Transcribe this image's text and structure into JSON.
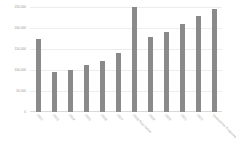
{
  "chart_data": {
    "type": "bar",
    "title": "",
    "subtitle": "",
    "xlabel": "",
    "ylabel": "",
    "legend": [],
    "legend_position": "none",
    "grid": true,
    "grid_axis": "y",
    "bar_color": "#8a8a8a",
    "gridline_color": "#ededed",
    "axis_color": "#d9d9d9",
    "tick_label_color": "#8f8f8f",
    "ylim": [
      0,
      250000
    ],
    "yticks": [
      0,
      50000,
      100000,
      150000,
      200000,
      250000
    ],
    "ytick_labels": [
      "0",
      "50,000",
      "100,000",
      "150,000",
      "200,000",
      "250,000"
    ],
    "xtick_rotation": 45,
    "categories": [
      "2012",
      "2013",
      "2014",
      "2015",
      "2016",
      "2017",
      "2018 Total Sales",
      "2019",
      "2020",
      "2021",
      "2022",
      "Cumulative Projected Total"
    ],
    "values": [
      175000,
      95000,
      100000,
      112000,
      122000,
      140000,
      250000,
      178000,
      190000,
      210000,
      228000,
      245000
    ]
  }
}
